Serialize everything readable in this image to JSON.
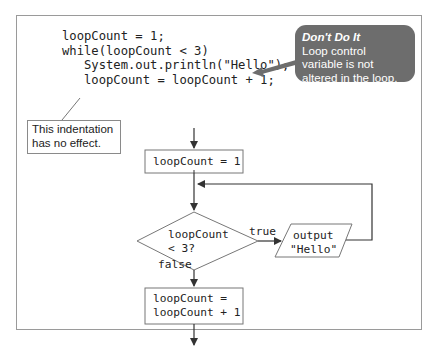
{
  "code": {
    "lines": [
      "loopCount = 1;",
      "while(loopCount < 3)",
      "   System.out.println(\"Hello\");",
      "   loopCount = loopCount + 1;"
    ]
  },
  "annotations": {
    "indentation_note": "This indentation has no effect.",
    "callout_title": "Don't Do It",
    "callout_body": "Loop control variable is not altered in the loop."
  },
  "flowchart": {
    "init_box": "loopCount = 1",
    "decision_line1": "loopCount",
    "decision_line2": "< 3?",
    "true_label": "true",
    "false_label": "false",
    "output_line1": "output",
    "output_line2": "\"Hello\"",
    "update_line1": "loopCount =",
    "update_line2": "loopCount + 1"
  },
  "colors": {
    "callout_bg": "#6d6d6d",
    "line": "#444444",
    "frame": "#9a9a9a"
  }
}
